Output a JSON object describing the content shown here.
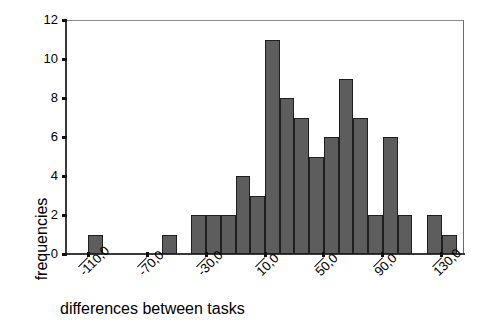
{
  "chart_data": {
    "type": "bar",
    "title": "",
    "xlabel": "differences between tasks",
    "ylabel": "frequencies",
    "xlim": [
      -125,
      145
    ],
    "ylim": [
      0,
      12
    ],
    "grid": false,
    "legend": null,
    "bin_width": 10,
    "x_tick_labels": [
      "-110,0",
      "-70,0",
      "-30,0",
      "10,0",
      "50,0",
      "90,0",
      "130,0"
    ],
    "x_tick_values": [
      -110,
      -70,
      -30,
      10,
      50,
      90,
      130
    ],
    "y_tick_labels": [
      "0",
      "2",
      "4",
      "6",
      "8",
      "10",
      "12"
    ],
    "y_tick_values": [
      0,
      2,
      4,
      6,
      8,
      10,
      12
    ],
    "bar_color": "#5d5d5d",
    "bar_edge_color": "#1f1f1f",
    "bin_centers": [
      -115,
      -105,
      -95,
      -85,
      -75,
      -65,
      -55,
      -45,
      -35,
      -25,
      -15,
      -5,
      5,
      15,
      25,
      35,
      45,
      55,
      65,
      75,
      85,
      95,
      105,
      115,
      125,
      135
    ],
    "values": [
      0,
      1,
      0,
      0,
      0,
      0,
      1,
      0,
      2,
      2,
      2,
      4,
      3,
      11,
      8,
      7,
      5,
      6,
      9,
      7,
      2,
      6,
      2,
      0,
      2,
      1
    ]
  },
  "axes": {
    "y_title": "frequencies",
    "x_title": "differences between tasks"
  }
}
